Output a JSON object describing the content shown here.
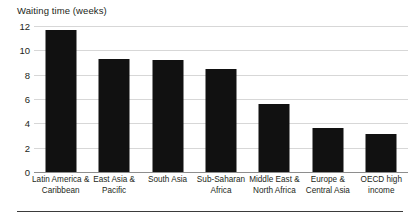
{
  "chart_data": {
    "type": "bar",
    "title": "Waiting time (weeks)",
    "xlabel": "",
    "ylabel": "",
    "ylim": [
      0,
      12
    ],
    "yticks": [
      0,
      2,
      4,
      6,
      8,
      10,
      12
    ],
    "grid": true,
    "legend": false,
    "bar_color": "#111111",
    "categories": [
      "Latin America & Caribbean",
      "East Asia & Pacific",
      "South Asia",
      "Sub-Saharan Africa",
      "Middle East & North Africa",
      "Europe & Central Asia",
      "OECD high income"
    ],
    "category_lines": [
      [
        "Latin America &",
        "Caribbean"
      ],
      [
        "East Asia &",
        "Pacific"
      ],
      [
        "South Asia"
      ],
      [
        "Sub-Saharan",
        "Africa"
      ],
      [
        "Middle East &",
        "North Africa"
      ],
      [
        "Europe &",
        "Central Asia"
      ],
      [
        "OECD high",
        "income"
      ]
    ],
    "values": [
      11.7,
      9.3,
      9.2,
      8.5,
      5.6,
      3.6,
      3.1
    ]
  }
}
